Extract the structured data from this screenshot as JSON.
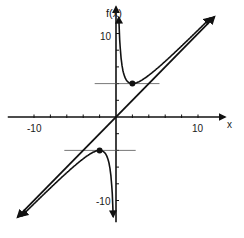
{
  "chart_data": {
    "type": "line",
    "title": "",
    "xlabel": "x",
    "ylabel": "f(x)",
    "xlim": [
      -12,
      12
    ],
    "ylim": [
      -12,
      12
    ],
    "grid": false,
    "legend": null,
    "x_tick_labels": [
      {
        "value": -10,
        "label": "-10"
      },
      {
        "value": 10,
        "label": "10"
      }
    ],
    "y_tick_labels": [
      {
        "value": 10,
        "label": "10"
      },
      {
        "value": -10,
        "label": "-10"
      }
    ],
    "x_ticks": [
      -10,
      -8,
      -6,
      -4,
      -2,
      2,
      4,
      6,
      8,
      10
    ],
    "y_ticks": [
      -10,
      -8,
      -6,
      -4,
      -2,
      2,
      4,
      6,
      8,
      10
    ],
    "series": [
      {
        "name": "f(x) = x + 4/x (x>0 branch)",
        "x": [
          0.35,
          0.5,
          1,
          1.5,
          2,
          3,
          4,
          6,
          8,
          10,
          11.5
        ],
        "y": [
          11.8,
          8.5,
          5,
          4.17,
          4,
          4.33,
          5,
          6.67,
          8.5,
          10.4,
          11.85
        ]
      },
      {
        "name": "f(x) = x + 4/x (x<0 branch)",
        "x": [
          -11.5,
          -10,
          -8,
          -6,
          -4,
          -3,
          -2,
          -1.5,
          -1,
          -0.5,
          -0.35
        ],
        "y": [
          -11.85,
          -10.4,
          -8.5,
          -6.67,
          -5,
          -4.33,
          -4,
          -4.17,
          -5,
          -8.5,
          -11.8
        ]
      },
      {
        "name": "slant asymptote y = x",
        "x": [
          -12,
          12
        ],
        "y": [
          -12,
          12
        ]
      }
    ],
    "annotations": [
      {
        "type": "point",
        "label": "local minimum",
        "x": 2,
        "y": 4
      },
      {
        "type": "point",
        "label": "local maximum",
        "x": -2,
        "y": -4
      },
      {
        "type": "hline",
        "y": 4,
        "x_from": -2.6,
        "x_to": 5.3
      },
      {
        "type": "hline",
        "y": -4,
        "x_from": -6.3,
        "x_to": 2.4
      },
      {
        "type": "vertical-asymptote",
        "x": 0
      }
    ]
  },
  "labels": {
    "y_axis": "f(x)",
    "x_axis": "x",
    "y_top": "10",
    "y_bottom": "-10",
    "x_left": "-10",
    "x_right": "10"
  }
}
